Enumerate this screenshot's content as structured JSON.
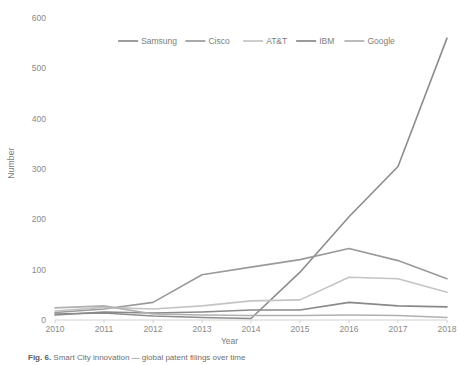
{
  "figure": {
    "caption_prefix": "Fig. 6.",
    "caption_text": "Smart City innovation — global patent filings over time"
  },
  "chart_data": {
    "type": "line",
    "title": "",
    "xlabel": "Year",
    "ylabel": "Number",
    "categories": [
      "2010",
      "2011",
      "2012",
      "2013",
      "2014",
      "2015",
      "2016",
      "2017",
      "2018"
    ],
    "x": [
      2010,
      2011,
      2012,
      2013,
      2014,
      2015,
      2016,
      2017,
      2018
    ],
    "xlim": [
      2010,
      2018
    ],
    "ylim": [
      0,
      600
    ],
    "yticks": [
      0,
      100,
      200,
      300,
      400,
      500,
      600
    ],
    "xticks": [
      "2010",
      "2011",
      "2012",
      "2013",
      "2014",
      "2015",
      "2016",
      "2017",
      "2018"
    ],
    "grid": false,
    "legend_position": "top-center",
    "series": [
      {
        "name": "Samsung",
        "color": "#8c8c8c",
        "values": [
          12,
          14,
          8,
          5,
          3,
          95,
          205,
          305,
          560
        ]
      },
      {
        "name": "Cisco",
        "color": "#9a9a9a",
        "values": [
          15,
          22,
          35,
          90,
          105,
          120,
          142,
          118,
          82
        ]
      },
      {
        "name": "AT&T",
        "color": "#c4c4c4",
        "values": [
          18,
          25,
          22,
          28,
          38,
          40,
          85,
          82,
          55
        ]
      },
      {
        "name": "IBM",
        "color": "#898989",
        "values": [
          10,
          16,
          14,
          16,
          20,
          20,
          35,
          28,
          26
        ]
      },
      {
        "name": "Google",
        "color": "#b0b0b0",
        "values": [
          24,
          28,
          12,
          10,
          9,
          9,
          10,
          9,
          5
        ]
      }
    ]
  },
  "legend": {
    "items": [
      {
        "label": "Samsung",
        "color": "#8c8c8c"
      },
      {
        "label": "Cisco",
        "color": "#9a9a9a"
      },
      {
        "label": "AT&T",
        "color": "#c4c4c4"
      },
      {
        "label": "IBM",
        "color": "#898989"
      },
      {
        "label": "Google",
        "color": "#b0b0b0"
      }
    ]
  },
  "axis": {
    "y_title": "Number",
    "x_title": "Year"
  }
}
